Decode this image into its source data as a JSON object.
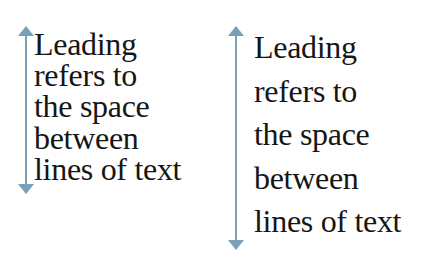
{
  "diagram": {
    "concept": "Leading",
    "arrow_color": "#7aa0b8",
    "text_color": "#161616",
    "examples": [
      {
        "id": "tight-leading",
        "lines": [
          "Leading",
          "refers to",
          "the space",
          "between",
          "lines of text"
        ],
        "arrow": {
          "icon": "double-headed-vertical-arrow-icon",
          "top": 28,
          "bottom": 194
        }
      },
      {
        "id": "loose-leading",
        "lines": [
          "Leading",
          "refers to",
          "the space",
          "between",
          "lines of text"
        ],
        "arrow": {
          "icon": "double-headed-vertical-arrow-icon",
          "top": 28,
          "bottom": 250
        }
      }
    ]
  }
}
